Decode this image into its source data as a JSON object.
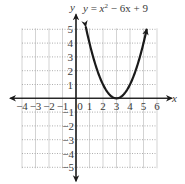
{
  "chart_data": {
    "type": "line",
    "title": "",
    "equation": {
      "lhs": "y",
      "eq": " = ",
      "base": "x",
      "exp": "2",
      "rest": " − 6x + 9"
    },
    "xlabel": "x",
    "ylabel": "y",
    "xlim": [
      -4,
      6
    ],
    "ylim": [
      -5,
      5
    ],
    "grid": true,
    "x_ticks": [
      "−4",
      "−3",
      "−2",
      "−1",
      "0",
      "1",
      "2",
      "3",
      "4",
      "5",
      "6"
    ],
    "y_ticks_pos": [
      "1",
      "2",
      "3",
      "4",
      "5"
    ],
    "y_ticks_neg": [
      "−1",
      "−2",
      "−3",
      "−4",
      "−5"
    ],
    "series": [
      {
        "name": "y = x^2 - 6x + 9",
        "x": [
          0.7,
          1,
          1.5,
          2,
          2.5,
          3,
          3.5,
          4,
          4.5,
          5,
          5.3
        ],
        "y": [
          5.29,
          4,
          2.25,
          1,
          0.25,
          0,
          0.25,
          1,
          2.25,
          4,
          5.29
        ]
      }
    ],
    "vertex": [
      3,
      0
    ],
    "colors": {
      "curve": "#1a1a1a",
      "axes": "#1a1a1a",
      "grid": "#c8c8c8"
    }
  }
}
